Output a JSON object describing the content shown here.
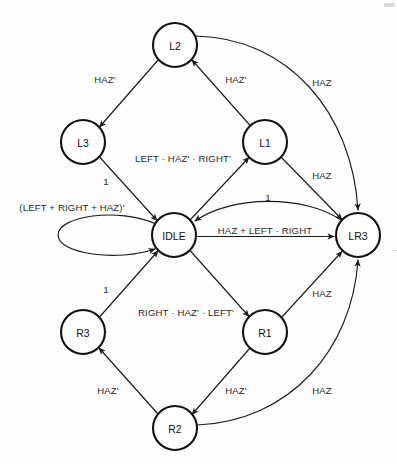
{
  "diagram": {
    "type": "state-transition-diagram",
    "canvas": {
      "width": 397,
      "height": 464,
      "background": "#fefefe"
    },
    "style": {
      "node_fill": "#ffffff",
      "node_stroke": "#111111",
      "node_radius": 22,
      "edge_stroke": "#1a1a1a",
      "label_color": "#2a2a2a"
    },
    "nodes": [
      {
        "id": "L2",
        "label": "L2",
        "cx": 175,
        "cy": 45,
        "r": 22
      },
      {
        "id": "L3",
        "label": "L3",
        "cx": 83,
        "cy": 142,
        "r": 22
      },
      {
        "id": "L1",
        "label": "L1",
        "cx": 265,
        "cy": 142,
        "r": 22
      },
      {
        "id": "IDLE",
        "label": "IDLE",
        "cx": 174,
        "cy": 235,
        "r": 22
      },
      {
        "id": "LR3",
        "label": "LR3",
        "cx": 358,
        "cy": 235,
        "r": 22
      },
      {
        "id": "R3",
        "label": "R3",
        "cx": 83,
        "cy": 332,
        "r": 22
      },
      {
        "id": "R1",
        "label": "R1",
        "cx": 265,
        "cy": 332,
        "r": 22
      },
      {
        "id": "R2",
        "label": "R2",
        "cx": 175,
        "cy": 428,
        "r": 22
      }
    ],
    "edges": [
      {
        "id": "e-l2-l3",
        "from": "L2",
        "to": "L3",
        "label": "HAZ'",
        "lx": 105,
        "ly": 79
      },
      {
        "id": "e-l1-l2",
        "from": "L1",
        "to": "L2",
        "label": "HAZ'",
        "lx": 236,
        "ly": 79
      },
      {
        "id": "e-l2-lr3",
        "from": "L2",
        "to": "LR3",
        "label": "HAZ",
        "lx": 322,
        "ly": 82
      },
      {
        "id": "e-l3-idle",
        "from": "L3",
        "to": "IDLE",
        "label": "1",
        "lx": 106,
        "ly": 181
      },
      {
        "id": "e-idle-l1",
        "from": "IDLE",
        "to": "L1",
        "label": "LEFT · HAZ' · RIGHT'",
        "lx": 183,
        "ly": 158
      },
      {
        "id": "e-l1-lr3",
        "from": "L1",
        "to": "LR3",
        "label": "HAZ",
        "lx": 322,
        "ly": 175
      },
      {
        "id": "e-lr3-idle",
        "from": "LR3",
        "to": "IDLE",
        "label": "1",
        "lx": 268,
        "ly": 197
      },
      {
        "id": "e-idle-lr3",
        "from": "IDLE",
        "to": "LR3",
        "label": "HAZ + LEFT · RIGHT",
        "lx": 265,
        "ly": 230
      },
      {
        "id": "e-idle-idle",
        "from": "IDLE",
        "to": "IDLE",
        "label": "(LEFT + RIGHT + HAZ)'",
        "lx": 72,
        "ly": 207
      },
      {
        "id": "e-r3-idle",
        "from": "R3",
        "to": "IDLE",
        "label": "1",
        "lx": 106,
        "ly": 289
      },
      {
        "id": "e-idle-r1",
        "from": "IDLE",
        "to": "R1",
        "label": "RIGHT · HAZ' · LEFT'",
        "lx": 186,
        "ly": 312
      },
      {
        "id": "e-r1-lr3",
        "from": "R1",
        "to": "LR3",
        "label": "HAZ",
        "lx": 322,
        "ly": 293
      },
      {
        "id": "e-r1-r2",
        "from": "R1",
        "to": "R2",
        "label": "HAZ'",
        "lx": 236,
        "ly": 390
      },
      {
        "id": "e-r2-r3",
        "from": "R2",
        "to": "R3",
        "label": "HAZ'",
        "lx": 108,
        "ly": 390
      },
      {
        "id": "e-r2-lr3",
        "from": "R2",
        "to": "LR3",
        "label": "HAZ",
        "lx": 322,
        "ly": 390
      }
    ]
  }
}
